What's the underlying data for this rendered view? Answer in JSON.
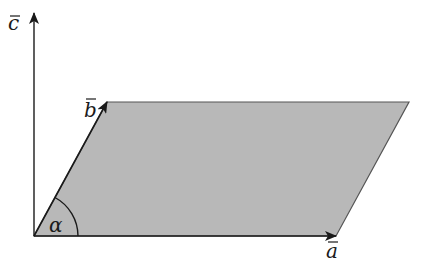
{
  "diagram": {
    "type": "vector parallelogram",
    "colors": {
      "fill": "#b8b8b8",
      "stroke": "#333333",
      "axis": "#1a1a1a"
    },
    "vectors": [
      {
        "name": "a",
        "label": "a",
        "from": [
          34,
          236
        ],
        "to": [
          336,
          236
        ]
      },
      {
        "name": "b",
        "label": "b",
        "from": [
          34,
          236
        ],
        "to": [
          107,
          102
        ]
      },
      {
        "name": "c",
        "label": "c",
        "from": [
          34,
          236
        ],
        "to": [
          34,
          13
        ]
      }
    ],
    "parallelogram": [
      [
        34,
        236
      ],
      [
        107,
        102
      ],
      [
        409,
        102
      ],
      [
        336,
        236
      ]
    ],
    "angle": {
      "label": "α",
      "between": [
        "a",
        "b"
      ],
      "radius": 44
    }
  }
}
